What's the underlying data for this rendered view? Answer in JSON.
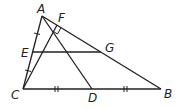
{
  "diagram": {
    "type": "geometry-triangle",
    "stroke_color": "#231f20",
    "points": {
      "A": {
        "label": "A",
        "x": 42,
        "y": 16
      },
      "B": {
        "label": "B",
        "x": 161,
        "y": 89
      },
      "C": {
        "label": "C",
        "x": 23,
        "y": 89
      },
      "D": {
        "label": "D",
        "x": 92,
        "y": 89
      },
      "E": {
        "label": "E",
        "x": 32,
        "y": 52
      },
      "F": {
        "label": "F",
        "x": 57,
        "y": 25
      },
      "G": {
        "label": "G",
        "x": 101,
        "y": 52
      }
    },
    "segments": [
      "AB",
      "AC",
      "CB",
      "AD",
      "CF",
      "EG"
    ],
    "markings": {
      "right_angle_at": "F",
      "single_tick": [
        "AE",
        "EC"
      ],
      "double_tick": [
        "CD",
        "DB"
      ]
    }
  }
}
